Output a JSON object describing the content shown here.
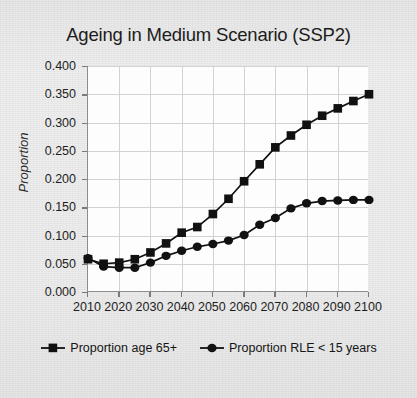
{
  "chart_data": {
    "type": "line",
    "title": "Ageing in Medium Scenario (SSP2)",
    "xlabel": "",
    "ylabel": "Proportion",
    "xlim": [
      2010,
      2100
    ],
    "ylim": [
      0.0,
      0.4
    ],
    "grid": true,
    "legend_position": "bottom",
    "x": [
      2010,
      2015,
      2020,
      2025,
      2030,
      2035,
      2040,
      2045,
      2050,
      2055,
      2060,
      2065,
      2070,
      2075,
      2080,
      2085,
      2090,
      2095,
      2100
    ],
    "xticks": [
      "2010",
      "2020",
      "2030",
      "2040",
      "2050",
      "2060",
      "2070",
      "2080",
      "2090",
      "2100"
    ],
    "xtick_values": [
      2010,
      2020,
      2030,
      2040,
      2050,
      2060,
      2070,
      2080,
      2090,
      2100
    ],
    "yticks": [
      "0.000",
      "0.050",
      "0.100",
      "0.150",
      "0.200",
      "0.250",
      "0.300",
      "0.350",
      "0.400"
    ],
    "ytick_values": [
      0.0,
      0.05,
      0.1,
      0.15,
      0.2,
      0.25,
      0.3,
      0.35,
      0.4
    ],
    "series": [
      {
        "name": "Proportion age 65+",
        "marker": "square",
        "color": "#111111",
        "values": [
          0.058,
          0.05,
          0.052,
          0.058,
          0.07,
          0.086,
          0.105,
          0.115,
          0.138,
          0.165,
          0.196,
          0.226,
          0.256,
          0.277,
          0.296,
          0.312,
          0.325,
          0.338,
          0.35
        ]
      },
      {
        "name": "Proportion RLE < 15 years",
        "marker": "circle",
        "color": "#111111",
        "values": [
          0.06,
          0.045,
          0.043,
          0.043,
          0.052,
          0.064,
          0.073,
          0.08,
          0.085,
          0.091,
          0.101,
          0.119,
          0.131,
          0.148,
          0.157,
          0.161,
          0.162,
          0.163,
          0.163
        ]
      }
    ]
  },
  "legend": {
    "items": [
      {
        "label": "Proportion age 65+",
        "marker": "square"
      },
      {
        "label": "Proportion RLE < 15 years",
        "marker": "circle"
      }
    ]
  }
}
